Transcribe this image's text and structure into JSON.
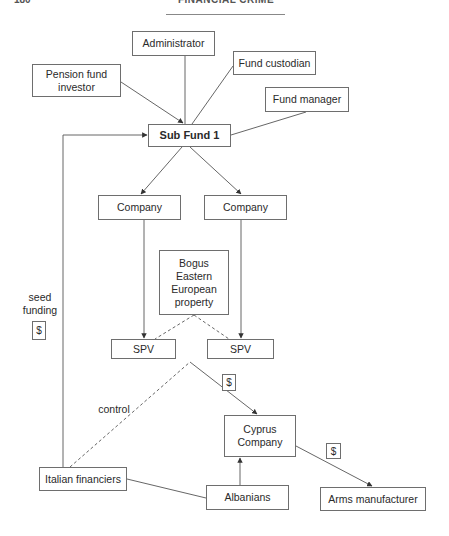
{
  "page_header": {
    "page_number": "180",
    "running_title": "FINANCIAL CRIME"
  },
  "diagram": {
    "nodes": {
      "administrator": "Administrator",
      "pension_fund_investor": "Pension fund\ninvestor",
      "fund_custodian": "Fund custodian",
      "fund_manager": "Fund manager",
      "sub_fund_1": "Sub Fund 1",
      "company_left": "Company",
      "company_right": "Company",
      "bogus_property": "Bogus\nEastern\nEuropean\nproperty",
      "spv_left": "SPV",
      "spv_right": "SPV",
      "cyprus_company": "Cyprus\nCompany",
      "italian_financiers": "Italian financiers",
      "albanians": "Albanians",
      "arms_manufacturer": "Arms manufacturer"
    },
    "labels": {
      "seed_funding": "seed\nfunding",
      "control": "control"
    },
    "money_markers": {
      "seed_funding_money": "$",
      "spv_to_cyprus_money": "$",
      "cyprus_to_arms_money": "$"
    },
    "edges": [
      {
        "from": "Administrator",
        "to": "Sub Fund 1",
        "style": "solid",
        "arrow": false
      },
      {
        "from": "Pension fund investor",
        "to": "Sub Fund 1",
        "style": "solid",
        "arrow": true
      },
      {
        "from": "Fund custodian",
        "to": "Sub Fund 1",
        "style": "solid",
        "arrow": false
      },
      {
        "from": "Fund manager",
        "to": "Sub Fund 1",
        "style": "solid",
        "arrow": false
      },
      {
        "from": "Sub Fund 1",
        "to": "Company (left)",
        "style": "solid",
        "arrow": true
      },
      {
        "from": "Sub Fund 1",
        "to": "Company (right)",
        "style": "solid",
        "arrow": true
      },
      {
        "from": "Company (left)",
        "to": "SPV (left)",
        "style": "solid",
        "arrow": true
      },
      {
        "from": "Company (right)",
        "to": "SPV (right)",
        "style": "solid",
        "arrow": true
      },
      {
        "from": "Bogus Eastern European property",
        "to": "SPV (left)",
        "style": "dashed",
        "arrow": false
      },
      {
        "from": "Bogus Eastern European property",
        "to": "SPV (right)",
        "style": "dashed",
        "arrow": false
      },
      {
        "from": "Italian financiers",
        "to": "Sub Fund 1",
        "style": "solid",
        "arrow": true,
        "label": "seed funding"
      },
      {
        "from": "Italian financiers",
        "to": "SPVs",
        "style": "dashed",
        "arrow": false,
        "label": "control"
      },
      {
        "from": "SPVs",
        "to": "Cyprus Company",
        "style": "solid",
        "arrow": true
      },
      {
        "from": "Albanians",
        "to": "Cyprus Company",
        "style": "solid",
        "arrow": true
      },
      {
        "from": "Italian financiers",
        "to": "Albanians",
        "style": "solid",
        "arrow": false
      },
      {
        "from": "Cyprus Company",
        "to": "Arms manufacturer",
        "style": "solid",
        "arrow": true
      }
    ],
    "colors": {
      "line": "#555555",
      "border": "#6e6e6e",
      "text": "#2a2a2a",
      "background": "#ffffff"
    }
  }
}
